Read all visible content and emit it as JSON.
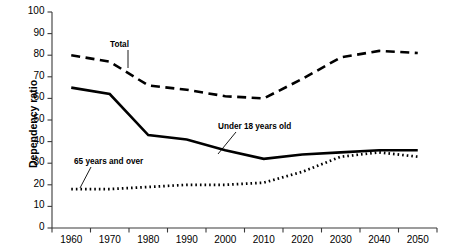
{
  "chart_data": {
    "type": "line",
    "title": "",
    "xlabel": "",
    "ylabel": "Dependency ratio",
    "ylim": [
      0,
      100
    ],
    "ytick_values": [
      0,
      10,
      20,
      30,
      40,
      50,
      60,
      70,
      80,
      90,
      100
    ],
    "ytick_labels": [
      "0",
      "10",
      "20",
      "30",
      "40",
      "50",
      "60",
      "70",
      "80",
      "90",
      "100"
    ],
    "categories": [
      "1960",
      "1970",
      "1980",
      "1990",
      "2000",
      "2010",
      "2020",
      "2030",
      "2040",
      "2050"
    ],
    "grid": false,
    "legend_position": "inline-annotations",
    "series": [
      {
        "name": "Total",
        "style": "dashed",
        "color": "#000000",
        "values": [
          80,
          77,
          66,
          64,
          61,
          60,
          69,
          79,
          82,
          81
        ]
      },
      {
        "name": "Under 18 years old",
        "style": "solid",
        "color": "#000000",
        "values": [
          65,
          62,
          43,
          41,
          36,
          32,
          34,
          35,
          36,
          36
        ]
      },
      {
        "name": "65 years and over",
        "style": "dotted",
        "color": "#000000",
        "values": [
          18,
          18,
          19,
          20,
          20,
          21,
          26,
          33,
          35,
          33
        ]
      }
    ],
    "annotations": [
      {
        "text": "Total",
        "series": "Total"
      },
      {
        "text": "Under 18 years old",
        "series": "Under 18 years old"
      },
      {
        "text": "65 years and over",
        "series": "65 years and over"
      }
    ]
  },
  "axes": {
    "y_axis_title": "Dependency ratio"
  }
}
